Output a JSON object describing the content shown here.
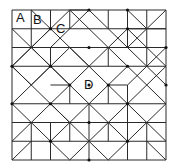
{
  "diagram": {
    "grid": {
      "cols": 8,
      "rows": 8,
      "x0": 12,
      "y0": 10,
      "cell_w": 19.25,
      "cell_h": 18.75
    },
    "stroke_color": "#2a2a2a",
    "labels": [
      {
        "text": "A",
        "x": 16,
        "y": 11
      },
      {
        "text": "B",
        "x": 33,
        "y": 13
      },
      {
        "text": "C",
        "x": 56,
        "y": 22
      },
      {
        "text": "D",
        "x": 84,
        "y": 78
      }
    ],
    "segments": [
      [
        0,
        0,
        8,
        0
      ],
      [
        0,
        8,
        8,
        8
      ],
      [
        0,
        0,
        0,
        8
      ],
      [
        8,
        0,
        8,
        8
      ],
      [
        1,
        0,
        1,
        2
      ],
      [
        2,
        0,
        2,
        1
      ],
      [
        3,
        0,
        3,
        1
      ],
      [
        0,
        1,
        2,
        1
      ],
      [
        2,
        1,
        8,
        1
      ],
      [
        1,
        0,
        2,
        1
      ],
      [
        2,
        1,
        3,
        0
      ],
      [
        3,
        0,
        4,
        1
      ],
      [
        3,
        0,
        4,
        0
      ],
      [
        4,
        0,
        6,
        2
      ],
      [
        4,
        0,
        2,
        2
      ],
      [
        6,
        0,
        7,
        1
      ],
      [
        6,
        0,
        6,
        2
      ],
      [
        5,
        0,
        5,
        1
      ],
      [
        7,
        0,
        7,
        2
      ],
      [
        6,
        1,
        8,
        1
      ],
      [
        7,
        1,
        8,
        0
      ],
      [
        7,
        1,
        6,
        2
      ],
      [
        0,
        1,
        2,
        3
      ],
      [
        2,
        1,
        4,
        3
      ],
      [
        0,
        3,
        2,
        1
      ],
      [
        2,
        2,
        2,
        3
      ],
      [
        0,
        2,
        8,
        2
      ],
      [
        2,
        1,
        1,
        2
      ],
      [
        1,
        2,
        0,
        3
      ],
      [
        1,
        2,
        3,
        4
      ],
      [
        3,
        2,
        4,
        3
      ],
      [
        3,
        2,
        1,
        4
      ],
      [
        2,
        3,
        4,
        5
      ],
      [
        4,
        1,
        6,
        3
      ],
      [
        4,
        3,
        6,
        1
      ],
      [
        6,
        2,
        8,
        4
      ],
      [
        8,
        2,
        6,
        4
      ],
      [
        6,
        1,
        8,
        3
      ],
      [
        0,
        3,
        8,
        3
      ],
      [
        0,
        3,
        1,
        4
      ],
      [
        0,
        5,
        2,
        3
      ],
      [
        0,
        3,
        3,
        6
      ],
      [
        4,
        3,
        2,
        5
      ],
      [
        5,
        2,
        5,
        3
      ],
      [
        7,
        2,
        7,
        3
      ],
      [
        6,
        3,
        4,
        5
      ],
      [
        4,
        3,
        6,
        5
      ],
      [
        6,
        3,
        8,
        5
      ],
      [
        8,
        3,
        6,
        5
      ],
      [
        3,
        4,
        3,
        5
      ],
      [
        2,
        4,
        3,
        4
      ],
      [
        5,
        4,
        6,
        4
      ],
      [
        6,
        4,
        6,
        6
      ],
      [
        5,
        4,
        5,
        5
      ],
      [
        0,
        5,
        8,
        5
      ],
      [
        0,
        5,
        2,
        7
      ],
      [
        2,
        5,
        4,
        7
      ],
      [
        2,
        5,
        0,
        7
      ],
      [
        4,
        5,
        2,
        7
      ],
      [
        4,
        5,
        6,
        7
      ],
      [
        6,
        5,
        4,
        7
      ],
      [
        6,
        5,
        8,
        7
      ],
      [
        8,
        5,
        6,
        7
      ],
      [
        4,
        5,
        4,
        8
      ],
      [
        2,
        6,
        2,
        8
      ],
      [
        1,
        6,
        1,
        8
      ],
      [
        7,
        6,
        7,
        8
      ],
      [
        6,
        6,
        6,
        8
      ],
      [
        0,
        6,
        8,
        6
      ],
      [
        0,
        7,
        8,
        7
      ],
      [
        2,
        7,
        3,
        8
      ],
      [
        3,
        8,
        4,
        7
      ],
      [
        4,
        7,
        5,
        8
      ],
      [
        5,
        8,
        6,
        7
      ],
      [
        1,
        7,
        0,
        8
      ],
      [
        7,
        7,
        8,
        8
      ],
      [
        3,
        6,
        3,
        7
      ],
      [
        5,
        6,
        5,
        7
      ]
    ],
    "nodes": [
      [
        4,
        0
      ],
      [
        6,
        0
      ],
      [
        2,
        1
      ],
      [
        6,
        1
      ],
      [
        4,
        2
      ],
      [
        8,
        2
      ],
      [
        0,
        3
      ],
      [
        2,
        3
      ],
      [
        6,
        3
      ],
      [
        4,
        4
      ],
      [
        8,
        4
      ],
      [
        2,
        5
      ],
      [
        6,
        5
      ],
      [
        0,
        5
      ],
      [
        4,
        6
      ],
      [
        2,
        7
      ],
      [
        6,
        7
      ],
      [
        4,
        8
      ],
      [
        3,
        4
      ],
      [
        5,
        4
      ]
    ]
  }
}
